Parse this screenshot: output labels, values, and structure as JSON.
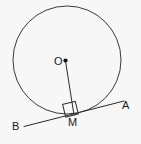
{
  "figure": {
    "background_color": "#f7f7f7",
    "stroke_color": "#3a3a3a",
    "label_color": "#1a1a1a",
    "labels": {
      "center": "O",
      "tangent_point": "M",
      "tangent_end_right": "A",
      "tangent_end_left": "B"
    },
    "geometry": {
      "circle": {
        "cx": 67,
        "cy": 60,
        "r": 54
      },
      "center_dot": {
        "cx": 65.5,
        "cy": 60.5,
        "r": 2.1
      },
      "radius_segment": {
        "x1": 65.5,
        "y1": 61,
        "x2": 74,
        "y2": 115
      },
      "tangent_segment": {
        "x1": 24,
        "y1": 126.5,
        "x2": 124,
        "y2": 101
      },
      "right_angle_marker": {
        "size": 13,
        "corner_x": 74,
        "corner_y": 115,
        "rotation_deg": -14
      }
    }
  }
}
